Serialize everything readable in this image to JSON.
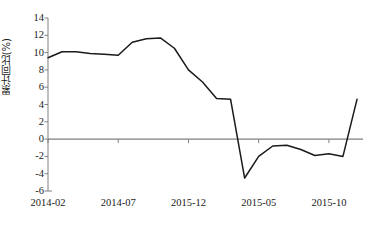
{
  "chart_data": {
    "type": "line",
    "title": "",
    "xlabel": "",
    "ylabel": "累计同比(%)",
    "ylim": [
      -6,
      14
    ],
    "yticks": [
      14,
      12,
      10,
      8,
      6,
      4,
      2,
      0,
      -2,
      -4,
      -6
    ],
    "ytick_labels": [
      "14",
      "12",
      "10",
      "8",
      "6",
      "4",
      "2",
      "0",
      "-2",
      "-4",
      "-6"
    ],
    "xtick_labels": [
      "2014-02",
      "2014-07",
      "2015-12",
      "2015-05",
      "2015-10"
    ],
    "xtick_positions": [
      0,
      5,
      10,
      15,
      20
    ],
    "grid": false,
    "legend": null,
    "zero_line": true,
    "line_color": "#1a1a1a",
    "axis_color": "#808080",
    "x": [
      0,
      1,
      2,
      3,
      4,
      5,
      6,
      7,
      8,
      9,
      10,
      11,
      12,
      13,
      14,
      15,
      16,
      17,
      18,
      19,
      20,
      21,
      22
    ],
    "values": [
      9.4,
      10.1,
      10.1,
      9.9,
      9.8,
      9.7,
      11.2,
      11.6,
      11.7,
      10.5,
      8.0,
      6.6,
      4.7,
      4.6,
      -4.5,
      -2.0,
      -0.8,
      -0.7,
      -1.2,
      -1.9,
      -1.7,
      -2.0,
      4.6
    ],
    "series": [
      {
        "name": "累计同比(%)",
        "values": [
          9.4,
          10.1,
          10.1,
          9.9,
          9.8,
          9.7,
          11.2,
          11.6,
          11.7,
          10.5,
          8.0,
          6.6,
          4.7,
          4.6,
          -4.5,
          -2.0,
          -0.8,
          -0.7,
          -1.2,
          -1.9,
          -1.7,
          -2.0,
          4.6
        ]
      }
    ],
    "annotations": []
  },
  "caption": {
    "text": ""
  }
}
